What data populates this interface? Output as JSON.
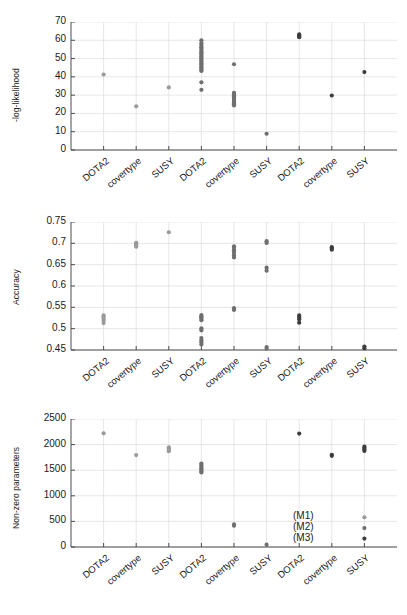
{
  "figure": {
    "background": "#ffffff",
    "model_groups": [
      "(M1)",
      "(M2)",
      "(M3)"
    ],
    "group_colors": [
      "#9a9a9a",
      "#6f6f6f",
      "#3d3d3d"
    ],
    "datasets": [
      "DOTA2",
      "covertype",
      "SUSY"
    ]
  },
  "legend": {
    "items": [
      {
        "label": "(M1)",
        "color": "#9a9a9a"
      },
      {
        "label": "(M2)",
        "color": "#6f6f6f"
      },
      {
        "label": "(M3)",
        "color": "#3d3d3d"
      }
    ]
  },
  "chart_data": [
    {
      "type": "scatter",
      "title": "",
      "xlabel": "",
      "ylabel": "-log-likelihood",
      "ylim": [
        0,
        70
      ],
      "yticks": [
        0,
        10,
        20,
        30,
        40,
        50,
        60,
        70
      ],
      "ytick_labels": [
        "0",
        "10",
        "20",
        "30",
        "40",
        "50",
        "60",
        "70"
      ],
      "grid": true,
      "xtick_labels": [
        "DOTA2",
        "covertype",
        "SUSY",
        "DOTA2",
        "covertype",
        "SUSY",
        "DOTA2",
        "covertype",
        "SUSY"
      ],
      "series": [
        {
          "name": "(M1)",
          "color": "#9a9a9a",
          "points": [
            {
              "x": 1,
              "dataset": "DOTA2",
              "values": [
                41.3
              ]
            },
            {
              "x": 2,
              "dataset": "covertype",
              "values": [
                23.9
              ]
            },
            {
              "x": 3,
              "dataset": "SUSY",
              "values": [
                34.2
              ]
            }
          ]
        },
        {
          "name": "(M2)",
          "color": "#6f6f6f",
          "points": [
            {
              "x": 4,
              "dataset": "DOTA2",
              "values": [
                60.0,
                58.4,
                57.1,
                56.2,
                55.4,
                54.3,
                53.5,
                52.8,
                52.0,
                51.2,
                50.5,
                49.8,
                49.0,
                48.2,
                47.5,
                46.8,
                46.0,
                45.2,
                44.5,
                43.8,
                43.2,
                37.0,
                32.9
              ]
            },
            {
              "x": 5,
              "dataset": "covertype",
              "values": [
                46.9,
                31.2,
                30.4,
                29.8,
                29.2,
                28.6,
                28.0,
                27.4,
                26.8,
                26.2,
                25.6,
                25.0,
                24.4
              ]
            },
            {
              "x": 6,
              "dataset": "SUSY",
              "values": [
                8.9
              ]
            }
          ]
        },
        {
          "name": "(M3)",
          "color": "#3d3d3d",
          "points": [
            {
              "x": 7,
              "dataset": "DOTA2",
              "values": [
                63.2,
                62.6,
                62.1,
                61.7
              ]
            },
            {
              "x": 8,
              "dataset": "covertype",
              "values": [
                29.8
              ]
            },
            {
              "x": 9,
              "dataset": "SUSY",
              "values": [
                42.6
              ]
            }
          ]
        }
      ]
    },
    {
      "type": "scatter",
      "title": "",
      "xlabel": "",
      "ylabel": "Accuracy",
      "ylim": [
        0.45,
        0.75
      ],
      "yticks": [
        0.45,
        0.5,
        0.55,
        0.6,
        0.65,
        0.7,
        0.75
      ],
      "ytick_labels": [
        "0.45",
        "0.5",
        "0.55",
        "0.6",
        "0.65",
        "0.7",
        "0.75"
      ],
      "grid": true,
      "xtick_labels": [
        "DOTA2",
        "covertype",
        "SUSY",
        "DOTA2",
        "covertype",
        "SUSY",
        "DOTA2",
        "covertype",
        "SUSY"
      ],
      "series": [
        {
          "name": "(M1)",
          "color": "#9a9a9a",
          "points": [
            {
              "x": 1,
              "dataset": "DOTA2",
              "values": [
                0.531,
                0.528,
                0.524,
                0.519,
                0.513
              ]
            },
            {
              "x": 2,
              "dataset": "covertype",
              "values": [
                0.701,
                0.699,
                0.697,
                0.694,
                0.692
              ]
            },
            {
              "x": 3,
              "dataset": "SUSY",
              "values": [
                0.726
              ]
            }
          ]
        },
        {
          "name": "(M2)",
          "color": "#6f6f6f",
          "points": [
            {
              "x": 4,
              "dataset": "DOTA2",
              "values": [
                0.532,
                0.529,
                0.526,
                0.523,
                0.52,
                0.501,
                0.496,
                0.478,
                0.473,
                0.468,
                0.463
              ]
            },
            {
              "x": 5,
              "dataset": "covertype",
              "values": [
                0.693,
                0.689,
                0.684,
                0.678,
                0.672,
                0.667,
                0.548,
                0.544
              ]
            },
            {
              "x": 6,
              "dataset": "SUSY",
              "values": [
                0.705,
                0.701,
                0.643,
                0.636,
                0.457,
                0.453
              ]
            }
          ]
        },
        {
          "name": "(M3)",
          "color": "#3d3d3d",
          "points": [
            {
              "x": 7,
              "dataset": "DOTA2",
              "values": [
                0.531,
                0.527,
                0.522,
                0.514
              ]
            },
            {
              "x": 8,
              "dataset": "covertype",
              "values": [
                0.691,
                0.688,
                0.685
              ]
            },
            {
              "x": 9,
              "dataset": "SUSY",
              "values": [
                0.458,
                0.454
              ]
            }
          ]
        }
      ]
    },
    {
      "type": "scatter",
      "title": "",
      "xlabel": "",
      "ylabel": "Non-zero parameters",
      "ylim": [
        0,
        2500
      ],
      "yticks": [
        0,
        500,
        1000,
        1500,
        2000,
        2500
      ],
      "ytick_labels": [
        "0",
        "500",
        "1000",
        "1500",
        "2000",
        "2500"
      ],
      "grid": true,
      "xtick_labels": [
        "DOTA2",
        "covertype",
        "SUSY",
        "DOTA2",
        "covertype",
        "SUSY",
        "DOTA2",
        "covertype",
        "SUSY"
      ],
      "series": [
        {
          "name": "(M1)",
          "color": "#9a9a9a",
          "points": [
            {
              "x": 1,
              "dataset": "DOTA2",
              "values": [
                2220
              ]
            },
            {
              "x": 2,
              "dataset": "covertype",
              "values": [
                1795
              ]
            },
            {
              "x": 3,
              "dataset": "SUSY",
              "values": [
                1945,
                1920,
                1895,
                1870
              ]
            }
          ]
        },
        {
          "name": "(M2)",
          "color": "#6f6f6f",
          "points": [
            {
              "x": 4,
              "dataset": "DOTA2",
              "values": [
                1630,
                1600,
                1570,
                1540,
                1510,
                1480,
                1455
              ]
            },
            {
              "x": 5,
              "dataset": "covertype",
              "values": [
                440,
                415
              ]
            },
            {
              "x": 6,
              "dataset": "SUSY",
              "values": [
                45
              ]
            }
          ]
        },
        {
          "name": "(M3)",
          "color": "#3d3d3d",
          "points": [
            {
              "x": 7,
              "dataset": "DOTA2",
              "values": [
                2215
              ]
            },
            {
              "x": 8,
              "dataset": "covertype",
              "values": [
                1800,
                1780
              ]
            },
            {
              "x": 9,
              "dataset": "SUSY",
              "values": [
                1960,
                1935,
                1905,
                1875
              ]
            }
          ]
        }
      ],
      "legend_markers": [
        {
          "label": "(M1)",
          "color": "#9a9a9a",
          "y": 580
        },
        {
          "label": "(M2)",
          "color": "#6f6f6f",
          "y": 370
        },
        {
          "label": "(M3)",
          "color": "#3d3d3d",
          "y": 165
        }
      ]
    }
  ]
}
